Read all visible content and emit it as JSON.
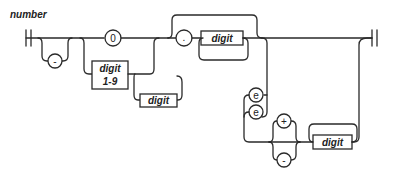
{
  "diagram": {
    "title": "number",
    "terminals": {
      "minus": "-",
      "zero": "0",
      "dot": ".",
      "e_lower": "e",
      "e_upper": "e",
      "plus": "+",
      "minus_exp": "-"
    },
    "nonterminals": {
      "digit_1_9_line1": "digit",
      "digit_1_9_line2": "1-9",
      "digit_int": "digit",
      "digit_frac": "digit",
      "digit_exp": "digit"
    }
  }
}
